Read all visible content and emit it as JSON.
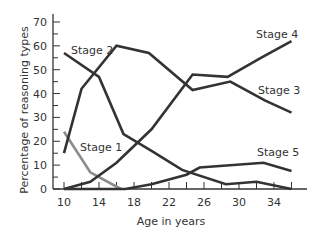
{
  "chart_data": {
    "type": "line",
    "title": "",
    "xlabel": "Age in years",
    "ylabel": "Percentage of reasoning types",
    "xlim": [
      10,
      36
    ],
    "ylim": [
      0,
      70
    ],
    "x_ticks": [
      10,
      14,
      18,
      22,
      26,
      30,
      34
    ],
    "y_ticks": [
      0,
      10,
      20,
      30,
      40,
      50,
      60,
      70
    ],
    "grid": false,
    "legend": "inline labels",
    "series": [
      {
        "name": "Stage 1",
        "color": "#8c8c8c",
        "label_pos": [
          80,
          151
        ],
        "points": [
          [
            10,
            24
          ],
          [
            13,
            7
          ],
          [
            16.5,
            0
          ]
        ]
      },
      {
        "name": "Stage 2",
        "color": "#333333",
        "label_pos": [
          71,
          54
        ],
        "points": [
          [
            10,
            57
          ],
          [
            14,
            47
          ],
          [
            16.8,
            23
          ],
          [
            20,
            16
          ],
          [
            23.5,
            8
          ],
          [
            28.5,
            2
          ],
          [
            32,
            3
          ],
          [
            36,
            0
          ]
        ]
      },
      {
        "name": "Stage 3",
        "color": "#333333",
        "label_pos": [
          258,
          94
        ],
        "points": [
          [
            10,
            15
          ],
          [
            12,
            42
          ],
          [
            16,
            60
          ],
          [
            19.7,
            57
          ],
          [
            24.7,
            41.5
          ],
          [
            29,
            45
          ],
          [
            33,
            37
          ],
          [
            36,
            32
          ]
        ]
      },
      {
        "name": "Stage 4",
        "color": "#333333",
        "label_pos": [
          256,
          38
        ],
        "points": [
          [
            10,
            0
          ],
          [
            13,
            3
          ],
          [
            16,
            11
          ],
          [
            20,
            25
          ],
          [
            24.7,
            48
          ],
          [
            28.7,
            47
          ],
          [
            32.5,
            55
          ],
          [
            36,
            62
          ]
        ]
      },
      {
        "name": "Stage 5",
        "color": "#333333",
        "label_pos": [
          257,
          156
        ],
        "points": [
          [
            10,
            0
          ],
          [
            17,
            0
          ],
          [
            20,
            2
          ],
          [
            24,
            6
          ],
          [
            25.5,
            9
          ],
          [
            32.8,
            11
          ],
          [
            36,
            7.5
          ]
        ]
      }
    ]
  }
}
